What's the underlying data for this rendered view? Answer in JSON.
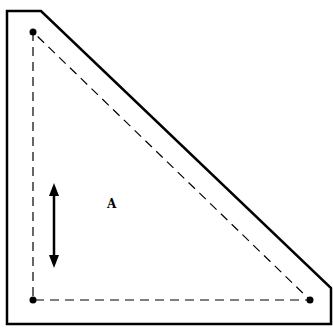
{
  "diagram": {
    "region_label": "A",
    "colors": {
      "stroke": "#000000",
      "background": "#ffffff"
    },
    "outer_outline": [
      [
        7,
        11
      ],
      [
        41,
        11
      ],
      [
        331,
        288
      ],
      [
        331,
        324
      ],
      [
        7,
        324
      ]
    ],
    "inner_dashed_triangle": [
      [
        33,
        32
      ],
      [
        33,
        300
      ],
      [
        310,
        300
      ]
    ],
    "vertex_points": [
      [
        33,
        32
      ],
      [
        33,
        300
      ],
      [
        310,
        300
      ]
    ],
    "arrow": {
      "type": "double-headed",
      "orientation": "vertical",
      "x": 54,
      "y1": 184,
      "y2": 267
    }
  }
}
